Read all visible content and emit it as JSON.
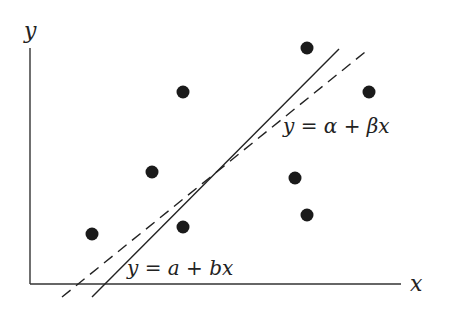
{
  "diagram": {
    "title": "",
    "axes": {
      "x_label": "x",
      "y_label": "y",
      "color": "#333333"
    },
    "points": [
      {
        "x": 92,
        "y": 234
      },
      {
        "x": 152,
        "y": 172
      },
      {
        "x": 183,
        "y": 92
      },
      {
        "x": 183,
        "y": 227
      },
      {
        "x": 295,
        "y": 178
      },
      {
        "x": 307,
        "y": 48
      },
      {
        "x": 307,
        "y": 215
      },
      {
        "x": 369,
        "y": 92
      }
    ],
    "point_color": "#1a1a1a",
    "lines": [
      {
        "name": "fitted-line",
        "style": "solid",
        "label": "y = a + bx",
        "x1": 92,
        "y1": 297,
        "x2": 339,
        "y2": 49
      },
      {
        "name": "true-line",
        "style": "dashed",
        "label": "y = α + βx",
        "x1": 62,
        "y1": 297,
        "x2": 370,
        "y2": 48
      }
    ],
    "labels": {
      "true_line": "y = α + βx",
      "fitted_line": "y = a + bx"
    }
  }
}
